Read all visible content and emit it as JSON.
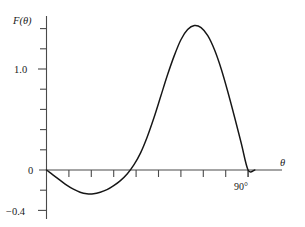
{
  "chart_data": {
    "type": "line",
    "title": "",
    "subtitle": "",
    "xlabel": "θ",
    "ylabel": "F(θ)",
    "grid": false,
    "legend": null,
    "xlim": [
      0,
      103
    ],
    "ylim": [
      -0.42,
      1.55
    ],
    "x_tick_labels": [
      "90°"
    ],
    "x_tick_label_values": [
      90
    ],
    "x_tick_values": [
      0,
      9,
      18,
      27,
      36,
      45,
      54,
      63,
      72,
      81,
      90
    ],
    "y_tick_labels": [
      "1.0",
      "0",
      "−0.4"
    ],
    "y_tick_label_values": [
      1.0,
      0,
      -0.4
    ],
    "y_tick_values": [
      -0.4,
      -0.2,
      0,
      0.2,
      0.4,
      0.6,
      0.8,
      1.0,
      1.2,
      1.4
    ],
    "series": [
      {
        "name": "F(θ)",
        "color": "#161616",
        "x": [
          0,
          3,
          6,
          9,
          12,
          15,
          18,
          21,
          24,
          27,
          30,
          33,
          36,
          39,
          42,
          45,
          48,
          51,
          54,
          57,
          60,
          63,
          66,
          69,
          72,
          75,
          78,
          81,
          84,
          87,
          90,
          93
        ],
        "y": [
          0.0,
          -0.05,
          -0.1,
          -0.15,
          -0.19,
          -0.22,
          -0.235,
          -0.235,
          -0.22,
          -0.195,
          -0.155,
          -0.105,
          -0.04,
          0.05,
          0.17,
          0.33,
          0.52,
          0.73,
          0.94,
          1.13,
          1.29,
          1.39,
          1.43,
          1.41,
          1.33,
          1.19,
          1.0,
          0.77,
          0.52,
          0.26,
          0.0,
          0.0
        ]
      }
    ],
    "annotations": [
      {
        "name": "peak",
        "x": 66,
        "y": 1.43,
        "text": ""
      },
      {
        "name": "trough",
        "x": 20,
        "y": -0.235,
        "text": ""
      },
      {
        "name": "zero-crossing",
        "x": 38,
        "y": 0,
        "text": ""
      }
    ]
  },
  "axes": {
    "y_axis_title": "F(θ)",
    "x_axis_title": "θ",
    "x_end_label": "90°",
    "y_label_top": "1.0",
    "y_label_zero": "0",
    "y_label_bottom": "−0.4"
  },
  "colors": {
    "curve": "#161616",
    "axis": "#4a4a4a",
    "background": "#ffffff",
    "text": "#1a1a1a"
  }
}
